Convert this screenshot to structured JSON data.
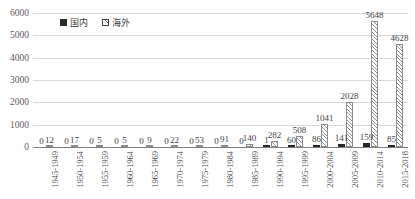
{
  "chart_data": {
    "type": "bar",
    "title": "",
    "subtitle": "",
    "xlabel": "",
    "ylabel": "",
    "ylim": [
      0,
      6000
    ],
    "ytick_labels": [
      "0",
      "1000",
      "2000",
      "3000",
      "4000",
      "5000",
      "6000"
    ],
    "ytick_values": [
      0,
      1000,
      2000,
      3000,
      4000,
      5000,
      6000
    ],
    "grid": true,
    "legend_position": "top-left",
    "categories": [
      "1945-1949",
      "1950-1954",
      "1955-1959",
      "1960-1964",
      "1965-1969",
      "1970-1974",
      "1975-1979",
      "1980-1984",
      "1985-1989",
      "1990-1994",
      "1995-1999",
      "2000-2004",
      "2005-2009",
      "2010-2014",
      "2015-2018"
    ],
    "series": [
      {
        "name": "国内",
        "fill": "solid-black",
        "color": "#262626",
        "values": [
          0,
          0,
          0,
          0,
          0,
          0,
          0,
          0,
          0,
          1,
          60,
          86,
          141,
          159,
          85
        ],
        "labels": [
          "0",
          "0",
          "0",
          "0",
          "0",
          "0",
          "0",
          "0",
          "0",
          "1",
          "60",
          "86",
          "141",
          "159",
          "85"
        ]
      },
      {
        "name": "海外",
        "fill": "diagonal-hatch",
        "color": "#909090",
        "values": [
          12,
          17,
          5,
          5,
          9,
          22,
          53,
          91,
          140,
          282,
          508,
          1041,
          2028,
          5648,
          4628
        ],
        "labels": [
          "12",
          "17",
          "5",
          "5",
          "9",
          "22",
          "53",
          "91",
          "140",
          "282",
          "508",
          "1041",
          "2028",
          "5648",
          "4628"
        ]
      }
    ]
  },
  "legend": {
    "items": [
      {
        "label": "国内",
        "swatch": "solid-square-icon"
      },
      {
        "label": "海外",
        "swatch": "hatched-square-icon"
      }
    ]
  }
}
